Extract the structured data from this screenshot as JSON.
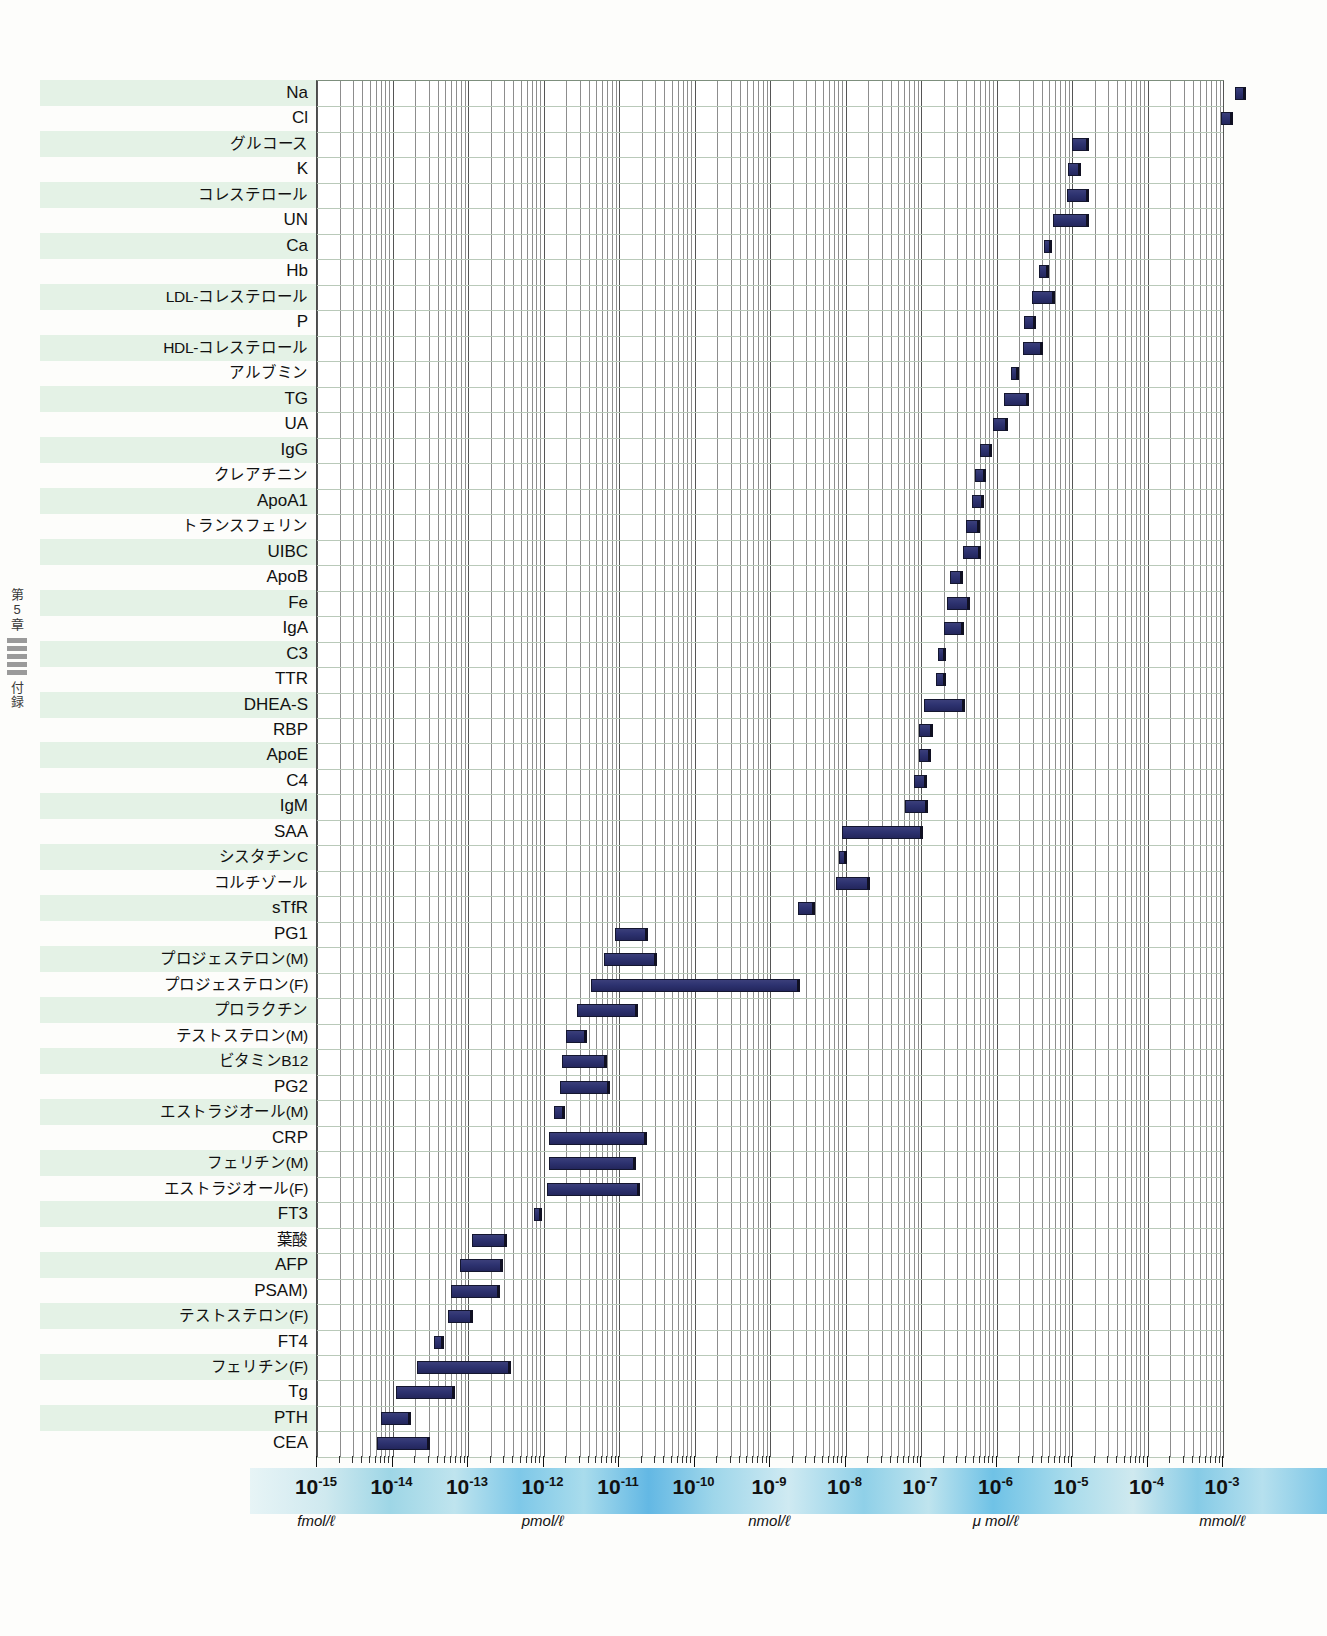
{
  "spine": {
    "chapter": "第5章",
    "section": "付録",
    "tick_count": 5
  },
  "chart_data": {
    "type": "bar",
    "orientation": "horizontal",
    "scale": "log10",
    "title": "",
    "xlabel": "",
    "ylabel": "",
    "xlim": [
      -15,
      -3
    ],
    "grid": true,
    "legend": false,
    "axis": {
      "exponents": [
        -15,
        -14,
        -13,
        -12,
        -11,
        -10,
        -9,
        -8,
        -7,
        -6,
        -5,
        -4,
        -3
      ],
      "base": "10",
      "unit_labels": [
        {
          "text": "fmol/ℓ",
          "exponent": -15
        },
        {
          "text": "pmol/ℓ",
          "exponent": -12
        },
        {
          "text": "nmol/ℓ",
          "exponent": -9
        },
        {
          "text": "μ mol/ℓ",
          "exponent": -6
        },
        {
          "text": "mmol/ℓ",
          "exponent": -3
        }
      ]
    },
    "categories": [
      "Na",
      "Cl",
      "グルコース",
      "K",
      "コレステロール",
      "UN",
      "Ca",
      "Hb",
      "LDL-コレステロール",
      "P",
      "HDL-コレステロール",
      "アルブミン",
      "TG",
      "UA",
      "IgG",
      "クレアチニン",
      "ApoA1",
      "トランスフェリン",
      "UIBC",
      "ApoB",
      "Fe",
      "IgA",
      "C3",
      "TTR",
      "DHEA-S",
      "RBP",
      "ApoE",
      "C4",
      "IgM",
      "SAA",
      "シスタチンC",
      "コルチゾール",
      "sTfR",
      "PG1",
      "プロジェステロン(M)",
      "プロジェステロン(F)",
      "プロラクチン",
      "テストステロン(M)",
      "ビタミンB12",
      "PG2",
      "エストラジオール(M)",
      "CRP",
      "フェリチン(M)",
      "エストラジオール(F)",
      "FT3",
      "葉酸",
      "AFP",
      "PSAM)",
      "テストステロン(F)",
      "FT4",
      "フェリチン(F)",
      "Tg",
      "PTH",
      "CEA"
    ],
    "ranges": [
      {
        "label": "Na",
        "lo": -2.84,
        "hi": -2.7
      },
      {
        "label": "Cl",
        "lo": -3.02,
        "hi": -2.87
      },
      {
        "label": "グルコース",
        "lo": -5.0,
        "hi": -4.77
      },
      {
        "label": "K",
        "lo": -5.05,
        "hi": -4.88
      },
      {
        "label": "コレステロール",
        "lo": -5.07,
        "hi": -4.78
      },
      {
        "label": "UN",
        "lo": -5.25,
        "hi": -4.77
      },
      {
        "label": "Ca",
        "lo": -5.37,
        "hi": -5.27
      },
      {
        "label": "Hb",
        "lo": -5.44,
        "hi": -5.3
      },
      {
        "label": "LDL-コレステロール",
        "lo": -5.53,
        "hi": -5.22
      },
      {
        "label": "P",
        "lo": -5.63,
        "hi": -5.48
      },
      {
        "label": "HDL-コレステロール",
        "lo": -5.65,
        "hi": -5.38
      },
      {
        "label": "アルブミン",
        "lo": -5.81,
        "hi": -5.72
      },
      {
        "label": "TG",
        "lo": -5.9,
        "hi": -5.57
      },
      {
        "label": "UA",
        "lo": -6.05,
        "hi": -5.85
      },
      {
        "label": "IgG",
        "lo": -6.22,
        "hi": -6.06
      },
      {
        "label": "クレアチニン",
        "lo": -6.29,
        "hi": -6.14
      },
      {
        "label": "ApoA1",
        "lo": -6.32,
        "hi": -6.17
      },
      {
        "label": "トランスフェリン",
        "lo": -6.41,
        "hi": -6.22
      },
      {
        "label": "UIBC",
        "lo": -6.45,
        "hi": -6.21
      },
      {
        "label": "ApoB",
        "lo": -6.61,
        "hi": -6.44
      },
      {
        "label": "Fe",
        "lo": -6.65,
        "hi": -6.35
      },
      {
        "label": "IgA",
        "lo": -6.7,
        "hi": -6.43
      },
      {
        "label": "C3",
        "lo": -6.78,
        "hi": -6.67
      },
      {
        "label": "TTR",
        "lo": -6.8,
        "hi": -6.67
      },
      {
        "label": "DHEA-S",
        "lo": -6.96,
        "hi": -6.42
      },
      {
        "label": "RBP",
        "lo": -7.02,
        "hi": -6.84
      },
      {
        "label": "ApoE",
        "lo": -7.03,
        "hi": -6.87
      },
      {
        "label": "C4",
        "lo": -7.09,
        "hi": -6.92
      },
      {
        "label": "IgM",
        "lo": -7.21,
        "hi": -6.91
      },
      {
        "label": "SAA",
        "lo": -8.05,
        "hi": -6.98
      },
      {
        "label": "シスタチンC",
        "lo": -8.09,
        "hi": -8.0
      },
      {
        "label": "コルチゾール",
        "lo": -8.12,
        "hi": -7.68
      },
      {
        "label": "sTfR",
        "lo": -8.63,
        "hi": -8.4
      },
      {
        "label": "PG1",
        "lo": -11.05,
        "hi": -10.62
      },
      {
        "label": "プロジェステロン(M)",
        "lo": -11.2,
        "hi": -10.5
      },
      {
        "label": "プロジェステロン(F)",
        "lo": -11.37,
        "hi": -8.6
      },
      {
        "label": "プロラクチン",
        "lo": -11.55,
        "hi": -10.75
      },
      {
        "label": "テストステロン(M)",
        "lo": -11.7,
        "hi": -11.42
      },
      {
        "label": "ビタミンB12",
        "lo": -11.75,
        "hi": -11.16
      },
      {
        "label": "PG2",
        "lo": -11.78,
        "hi": -11.12
      },
      {
        "label": "エストラジオール(M)",
        "lo": -11.86,
        "hi": -11.72
      },
      {
        "label": "CRP",
        "lo": -11.93,
        "hi": -10.63
      },
      {
        "label": "フェリチン(M)",
        "lo": -11.93,
        "hi": -10.78
      },
      {
        "label": "エストラジオール(F)",
        "lo": -11.96,
        "hi": -10.72
      },
      {
        "label": "FT3",
        "lo": -12.13,
        "hi": -12.03
      },
      {
        "label": "葉酸",
        "lo": -12.95,
        "hi": -12.48
      },
      {
        "label": "AFP",
        "lo": -13.1,
        "hi": -12.54
      },
      {
        "label": "PSAM)",
        "lo": -13.22,
        "hi": -12.58
      },
      {
        "label": "テストステロン(F)",
        "lo": -13.26,
        "hi": -12.93
      },
      {
        "label": "FT4",
        "lo": -13.45,
        "hi": -13.32
      },
      {
        "label": "フェリチン(F)",
        "lo": -13.67,
        "hi": -12.43
      },
      {
        "label": "Tg",
        "lo": -13.95,
        "hi": -13.17
      },
      {
        "label": "PTH",
        "lo": -14.15,
        "hi": -13.75
      },
      {
        "label": "CEA",
        "lo": -14.2,
        "hi": -13.5
      }
    ]
  }
}
